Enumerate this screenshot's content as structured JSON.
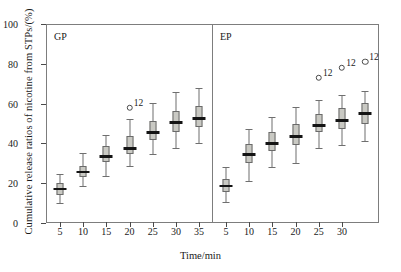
{
  "chart_data": {
    "type": "box",
    "title": "",
    "xlabel": "Time/min",
    "ylabel": "Cumulative release ratios of nicotine from STPs/(%)",
    "ylim": [
      0,
      100
    ],
    "yticks": [
      0,
      20,
      40,
      60,
      80,
      100
    ],
    "grid": false,
    "legend": "none",
    "panels": [
      {
        "name": "GP",
        "label": "GP",
        "xticks": [
          5,
          10,
          15,
          20,
          25,
          30,
          35
        ],
        "xlim": [
          2,
          38
        ],
        "boxes": [
          {
            "x": 5,
            "whisker_low": 10.0,
            "q1": 14.0,
            "median": 17.0,
            "q3": 20.0,
            "whisker_high": 24.5
          },
          {
            "x": 10,
            "whisker_low": 18.5,
            "q1": 23.0,
            "median": 25.5,
            "q3": 28.5,
            "whisker_high": 35.0
          },
          {
            "x": 15,
            "whisker_low": 23.5,
            "q1": 30.5,
            "median": 33.5,
            "q3": 38.5,
            "whisker_high": 44.0
          },
          {
            "x": 20,
            "whisker_low": 28.5,
            "q1": 34.5,
            "median": 37.5,
            "q3": 43.5,
            "whisker_high": 52.5
          },
          {
            "x": 25,
            "whisker_low": 34.5,
            "q1": 41.5,
            "median": 45.5,
            "q3": 51.5,
            "whisker_high": 60.5
          },
          {
            "x": 30,
            "whisker_low": 37.5,
            "q1": 45.5,
            "median": 50.5,
            "q3": 56.5,
            "whisker_high": 66.0
          },
          {
            "x": 35,
            "whisker_low": 40.0,
            "q1": 48.0,
            "median": 52.5,
            "q3": 59.0,
            "whisker_high": 68.0
          }
        ],
        "outliers": [
          {
            "x": 20,
            "y": 58.0,
            "label": "12"
          }
        ]
      },
      {
        "name": "EP",
        "label": "EP",
        "xticks": [
          5,
          10,
          15,
          20,
          25,
          30
        ],
        "xlim": [
          2,
          38
        ],
        "boxes": [
          {
            "x": 5,
            "whisker_low": 10.5,
            "q1": 15.5,
            "median": 18.5,
            "q3": 22.0,
            "whisker_high": 28.0
          },
          {
            "x": 10,
            "whisker_low": 21.0,
            "q1": 30.0,
            "median": 34.5,
            "q3": 39.5,
            "whisker_high": 47.0
          },
          {
            "x": 15,
            "whisker_low": 28.0,
            "q1": 36.0,
            "median": 40.0,
            "q3": 45.5,
            "whisker_high": 53.5
          },
          {
            "x": 20,
            "whisker_low": 30.0,
            "q1": 39.0,
            "median": 43.5,
            "q3": 50.0,
            "whisker_high": 58.5
          },
          {
            "x": 25,
            "whisker_low": 37.5,
            "q1": 45.5,
            "median": 49.0,
            "q3": 55.0,
            "whisker_high": 62.0
          },
          {
            "x": 30,
            "whisker_low": 39.0,
            "q1": 47.0,
            "median": 51.5,
            "q3": 58.0,
            "whisker_high": 64.5
          },
          {
            "x": 35,
            "whisker_low": 41.0,
            "q1": 49.5,
            "median": 55.0,
            "q3": 60.5,
            "whisker_high": 66.5
          }
        ],
        "outliers": [
          {
            "x": 25,
            "y": 73.0,
            "label": "12"
          },
          {
            "x": 30,
            "y": 78.0,
            "label": "12"
          },
          {
            "x": 35,
            "y": 81.0,
            "label": "12"
          }
        ]
      }
    ]
  },
  "axis": {
    "ylabel": "Cumulative release ratios of nicotine from STPs/(%)",
    "xlabel": "Time/min"
  }
}
